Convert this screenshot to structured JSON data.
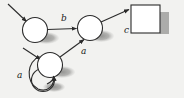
{
  "figure": {
    "kind": "state-transition-diagram",
    "background_color": "#f2f2f0",
    "stroke_color": "#2b2b2b",
    "node_fill_color": "#ffffff",
    "shadow_color": "#9a9a98",
    "label_color": "#1a1a1a"
  },
  "nodes": [
    {
      "id": "q1",
      "shape": "circle",
      "cx": 35,
      "cy": 30,
      "r": 12.5,
      "label": ""
    },
    {
      "id": "q2",
      "shape": "circle",
      "cx": 90,
      "cy": 28,
      "r": 12.5,
      "label": ""
    },
    {
      "id": "q3",
      "shape": "circle",
      "cx": 50,
      "cy": 65,
      "r": 12.5,
      "label": ""
    },
    {
      "id": "q4",
      "shape": "circle",
      "cx": 43,
      "cy": 80,
      "r": 11.5,
      "label": ""
    },
    {
      "id": "q5",
      "shape": "square",
      "x": 131,
      "y": 5,
      "w": 29,
      "h": 28,
      "label": ""
    }
  ],
  "edges": [
    {
      "id": "e-start-1",
      "from": "start",
      "to": "q1",
      "label": ""
    },
    {
      "id": "e-start-3",
      "from": "start",
      "to": "q3",
      "label": ""
    },
    {
      "id": "e-q1-q2",
      "from": "q1",
      "to": "q2",
      "label": "b",
      "label_x": 61,
      "label_y": 21
    },
    {
      "id": "e-q3-q2",
      "from": "q3",
      "to": "q2",
      "label": "a",
      "label_x": 81,
      "label_y": 54
    },
    {
      "id": "e-q3-loop",
      "from": "q3",
      "to": "q3",
      "label": "a",
      "label_x": 17,
      "label_y": 78
    },
    {
      "id": "e-q2-q5",
      "from": "q2",
      "to": "q5",
      "label": "c",
      "label_x": 124,
      "label_y": 33
    }
  ],
  "labels": {
    "b": "b",
    "a_mid": "a",
    "a_loop": "a",
    "c": "c"
  }
}
